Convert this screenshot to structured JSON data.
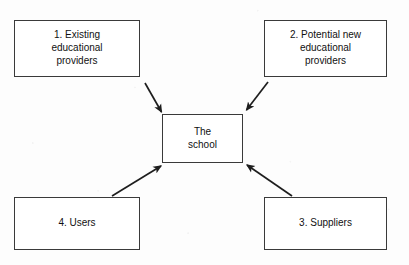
{
  "diagram": {
    "background_color": "#ffffff",
    "line_color": "#3a3a3a",
    "text_color": "#111111",
    "center": {
      "id": "school",
      "label": "The\nschool"
    },
    "nodes": [
      {
        "id": "existing-providers",
        "number": "1.",
        "label": "1. Existing\neducational\nproviders",
        "position": "top-left"
      },
      {
        "id": "potential-providers",
        "number": "2.",
        "label": "2. Potential new\neducational\nproviders",
        "position": "top-right"
      },
      {
        "id": "suppliers",
        "number": "3.",
        "label": "3. Suppliers",
        "position": "bottom-right"
      },
      {
        "id": "users",
        "number": "4.",
        "label": "4. Users",
        "position": "bottom-left"
      }
    ],
    "arrows": [
      {
        "id": "arrow-existing-to-school",
        "from": "existing-providers",
        "to": "school",
        "direction": "down-right",
        "head": "to"
      },
      {
        "id": "arrow-potential-to-school",
        "from": "potential-providers",
        "to": "school",
        "direction": "down-left",
        "head": "to"
      },
      {
        "id": "arrow-users-to-school",
        "from": "users",
        "to": "school",
        "direction": "up-right",
        "head": "to"
      },
      {
        "id": "arrow-suppliers-to-school",
        "from": "suppliers",
        "to": "school",
        "direction": "up-left",
        "head": "to"
      }
    ]
  }
}
